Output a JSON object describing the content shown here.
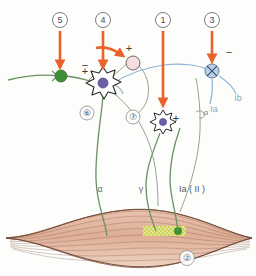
{
  "figure": {
    "background_color": "#fdfdfb"
  },
  "colors": {
    "arrow_orange": "#e8622a",
    "neuron_green": "#5f8a5a",
    "synapse_green": "#3a8a34",
    "afferent_blue": "#8fb4d6",
    "nucleus_purple": "#6b5fa8",
    "interneuron_pink": "#f4d8d8",
    "muscle_fill": "#e6b9a2",
    "muscle_line": "#8a5f4a",
    "spindle_yellow": "#c8d44a",
    "label_gray": "#6e6e6e",
    "outline_black": "#2a2a2a"
  },
  "callouts": [
    {
      "id": "c5",
      "label": "⓪",
      "number": "5",
      "glyph": "⑤",
      "x": 60,
      "y": 20,
      "arrow_x": 60,
      "arrow_y1": 30,
      "arrow_y2": 68
    },
    {
      "id": "c4",
      "label": "4",
      "number": "4",
      "glyph": "④",
      "x": 103,
      "y": 20,
      "arrow_x": 103,
      "arrow_y1": 30,
      "arrow_y2": 68
    },
    {
      "id": "c1",
      "label": "1",
      "number": "1",
      "glyph": "①",
      "x": 163,
      "y": 20,
      "arrow_x": 163,
      "arrow_y1": 30,
      "arrow_y2": 106
    },
    {
      "id": "c3",
      "label": "3",
      "number": "3",
      "glyph": "③",
      "x": 212,
      "y": 20,
      "arrow_x": 212,
      "arrow_y1": 30,
      "arrow_y2": 62
    }
  ],
  "inline_numbers": [
    {
      "id": "n6",
      "glyph": "⑥",
      "x": 87,
      "y": 113
    },
    {
      "id": "n7",
      "glyph": "⑦",
      "x": 133,
      "y": 117
    },
    {
      "id": "n2",
      "glyph": "②",
      "x": 187,
      "y": 258
    }
  ],
  "signs": [
    {
      "id": "s5",
      "text": "−",
      "x": 85,
      "y": 66
    },
    {
      "id": "s4",
      "text": "+",
      "x": 129,
      "y": 50
    },
    {
      "id": "s6",
      "text": "+",
      "x": 86,
      "y": 71
    },
    {
      "id": "s1",
      "text": "+",
      "x": 176,
      "y": 119
    },
    {
      "id": "s3",
      "text": "−",
      "x": 229,
      "y": 53
    }
  ],
  "nerve_labels": [
    {
      "id": "label-alpha",
      "text": "α",
      "x": 100,
      "y": 190,
      "color": "#6e6e6e",
      "size": 9
    },
    {
      "id": "label-gamma",
      "text": "γ",
      "x": 141,
      "y": 190,
      "color": "#6e6e6e",
      "size": 9
    },
    {
      "id": "label-ia-ii",
      "text": "Ia ( II )",
      "x": 178,
      "y": 190,
      "color": "#5a5a5a",
      "size": 9
    },
    {
      "id": "label-ia",
      "text": "Ia",
      "x": 216,
      "y": 109,
      "color": "#8fa8bd",
      "size": 9
    },
    {
      "id": "label-ib",
      "text": "Ib",
      "x": 237,
      "y": 98,
      "color": "#8fa8bd",
      "size": 9
    },
    {
      "id": "label-o",
      "text": "o",
      "x": 202,
      "y": 113,
      "color": "#6e6e6e",
      "size": 8
    }
  ],
  "structures": {
    "inhibitory_synapse": {
      "name": "green-synapse-terminal",
      "cx": 60,
      "cy": 76,
      "r": 6
    },
    "motor_neuron_6": {
      "name": "alpha-motor-neuron-soma",
      "cx": 103,
      "cy": 83,
      "nucleus_r": 5
    },
    "interneuron_pink": {
      "name": "excitatory-interneuron",
      "cx": 133,
      "cy": 63,
      "r": 7
    },
    "motor_neuron_gamma": {
      "name": "gamma-motor-neuron-soma",
      "cx": 163,
      "cy": 120,
      "nucleus_r": 3.5
    },
    "golgi_tendon_organ": {
      "name": "golgi-tendon-organ",
      "cx": 212,
      "cy": 71,
      "r": 7
    },
    "muscle": {
      "name": "skeletal-muscle-belly"
    },
    "muscle_spindle": {
      "name": "muscle-spindle",
      "x": 143,
      "y": 226,
      "w": 42,
      "h": 9
    }
  }
}
